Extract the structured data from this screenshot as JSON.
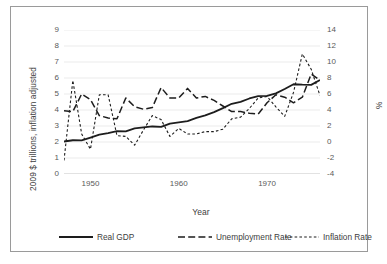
{
  "chart_data": {
    "type": "line",
    "title": "",
    "xlabel": "Year",
    "ylabel": "2009 $ trillions, inflation adjusted",
    "ylabel_secondary": "%",
    "xlim": [
      1947,
      1976
    ],
    "ylim": [
      0,
      9
    ],
    "ylim_secondary": [
      -4,
      14
    ],
    "grid": true,
    "legend_position": "bottom",
    "xticks": [
      "1950",
      "1960",
      "1970"
    ],
    "xtick_values": [
      1950,
      1960,
      1970
    ],
    "yticks_left": [
      "0",
      "1",
      "2",
      "3",
      "4",
      "5",
      "6",
      "7",
      "8",
      "9"
    ],
    "ytick_values_left": [
      0,
      1,
      2,
      3,
      4,
      5,
      6,
      7,
      8,
      9
    ],
    "yticks_right": [
      "-4",
      "-2",
      "0",
      "2",
      "4",
      "6",
      "8",
      "10",
      "12",
      "14"
    ],
    "ytick_values_right": [
      -4,
      -2,
      0,
      2,
      4,
      6,
      8,
      10,
      12,
      14
    ],
    "x": [
      1947,
      1948,
      1949,
      1950,
      1951,
      1952,
      1953,
      1954,
      1955,
      1956,
      1957,
      1958,
      1959,
      1960,
      1961,
      1962,
      1963,
      1964,
      1965,
      1966,
      1967,
      1968,
      1969,
      1970,
      1971,
      1972,
      1973,
      1974,
      1975,
      1976
    ],
    "series": [
      {
        "name": "Real GDP",
        "axis": "left",
        "style": "solid",
        "unit": "2009 $ trillions",
        "values": [
          2.03,
          2.11,
          2.1,
          2.28,
          2.46,
          2.56,
          2.68,
          2.66,
          2.85,
          2.91,
          2.97,
          2.95,
          3.15,
          3.23,
          3.31,
          3.51,
          3.66,
          3.87,
          4.12,
          4.39,
          4.51,
          4.72,
          4.87,
          4.88,
          5.04,
          5.31,
          5.61,
          5.58,
          5.57,
          5.87
        ]
      },
      {
        "name": "Unemployment Rate",
        "axis": "right",
        "style": "dashed-long",
        "unit": "%",
        "values": [
          3.9,
          3.8,
          6.0,
          5.3,
          3.3,
          3.0,
          2.9,
          5.5,
          4.4,
          4.1,
          4.3,
          6.8,
          5.5,
          5.5,
          6.7,
          5.5,
          5.7,
          5.2,
          4.5,
          3.8,
          3.8,
          3.6,
          3.5,
          4.9,
          5.9,
          5.6,
          4.9,
          5.6,
          8.5,
          7.7
        ]
      },
      {
        "name": "Inflation Rate",
        "axis": "right",
        "style": "dashed-short",
        "unit": "%",
        "values": [
          -2.3,
          7.7,
          1.0,
          -0.9,
          5.9,
          5.9,
          0.8,
          0.7,
          -0.4,
          1.5,
          3.3,
          2.8,
          0.7,
          1.7,
          1.0,
          1.0,
          1.3,
          1.3,
          1.6,
          2.9,
          3.1,
          4.2,
          5.5,
          5.7,
          4.4,
          3.2,
          6.2,
          11.0,
          9.1,
          5.8
        ]
      }
    ]
  },
  "legend": {
    "items": [
      {
        "label": "Real GDP",
        "style": "solid"
      },
      {
        "label": "Unemployment Rate",
        "style": "dashed-long"
      },
      {
        "label": "Inflation Rate",
        "style": "dashed-short"
      }
    ]
  }
}
